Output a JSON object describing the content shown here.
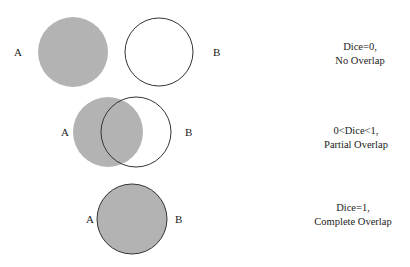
{
  "colors": {
    "fill": "#b3b3b3",
    "stroke": "#333333",
    "background": "#ffffff"
  },
  "rows": [
    {
      "label_a": "A",
      "label_b": "B",
      "caption_line1": "Dice=0,",
      "caption_line2": "No Overlap",
      "circle_a": {
        "cx": 73,
        "cy": 52,
        "r": 35
      },
      "circle_b": {
        "cx": 159,
        "cy": 52,
        "r": 34
      }
    },
    {
      "label_a": "A",
      "label_b": "B",
      "caption_line1": "0<Dice<1,",
      "caption_line2": "Partial Overlap",
      "circle_a": {
        "cx": 108,
        "cy": 132,
        "r": 35
      },
      "circle_b": {
        "cx": 136,
        "cy": 132,
        "r": 35
      }
    },
    {
      "label_a": "A",
      "label_b": "B",
      "caption_line1": "Dice=1,",
      "caption_line2": "Complete Overlap",
      "circle_a": {
        "cx": 132,
        "cy": 219,
        "r": 35
      },
      "circle_b": {
        "cx": 132,
        "cy": 219,
        "r": 35
      }
    }
  ]
}
